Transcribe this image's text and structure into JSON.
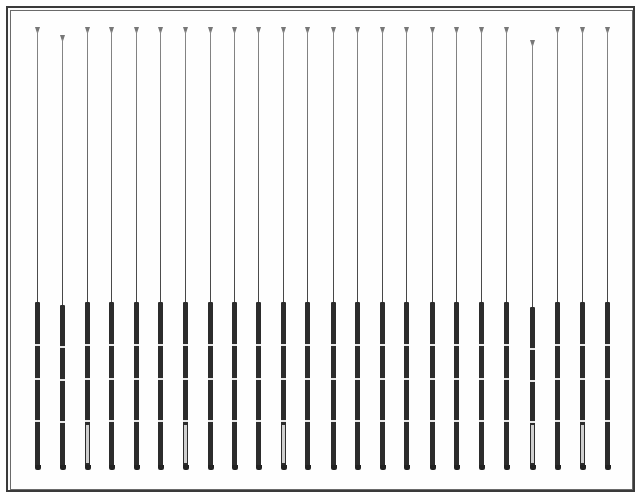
{
  "figure": {
    "rod_count": 24,
    "frame": {
      "outer_color": "#3a3a3a",
      "inner_color": "#6a6a6a",
      "background": "#fefefe"
    },
    "rods": [
      {
        "x": 37,
        "tip_y": 27,
        "light_grip": false
      },
      {
        "x": 62,
        "tip_y": 35,
        "light_grip": false
      },
      {
        "x": 87,
        "tip_y": 27,
        "light_grip": true
      },
      {
        "x": 111,
        "tip_y": 27,
        "light_grip": false
      },
      {
        "x": 136,
        "tip_y": 27,
        "light_grip": false
      },
      {
        "x": 160,
        "tip_y": 27,
        "light_grip": false
      },
      {
        "x": 185,
        "tip_y": 27,
        "light_grip": true
      },
      {
        "x": 210,
        "tip_y": 27,
        "light_grip": false
      },
      {
        "x": 234,
        "tip_y": 27,
        "light_grip": false
      },
      {
        "x": 258,
        "tip_y": 27,
        "light_grip": false
      },
      {
        "x": 283,
        "tip_y": 27,
        "light_grip": true
      },
      {
        "x": 307,
        "tip_y": 27,
        "light_grip": false
      },
      {
        "x": 333,
        "tip_y": 27,
        "light_grip": false
      },
      {
        "x": 357,
        "tip_y": 27,
        "light_grip": false
      },
      {
        "x": 382,
        "tip_y": 27,
        "light_grip": false
      },
      {
        "x": 406,
        "tip_y": 27,
        "light_grip": false
      },
      {
        "x": 432,
        "tip_y": 27,
        "light_grip": false
      },
      {
        "x": 456,
        "tip_y": 27,
        "light_grip": false
      },
      {
        "x": 481,
        "tip_y": 27,
        "light_grip": false
      },
      {
        "x": 506,
        "tip_y": 27,
        "light_grip": false
      },
      {
        "x": 532,
        "tip_y": 40,
        "light_grip": true
      },
      {
        "x": 557,
        "tip_y": 27,
        "light_grip": false
      },
      {
        "x": 582,
        "tip_y": 27,
        "light_grip": true
      },
      {
        "x": 607,
        "tip_y": 27,
        "light_grip": false
      }
    ],
    "rod_bottom_y": 470
  }
}
